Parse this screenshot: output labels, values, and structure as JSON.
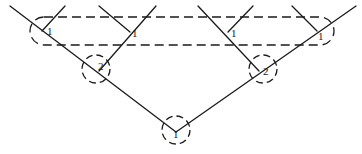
{
  "diagram": {
    "type": "tree",
    "colors": {
      "stroke": "#1a1a1a",
      "background": "#ffffff"
    },
    "nodes": [
      {
        "id": "root",
        "label": "1",
        "x": 176,
        "y": 130
      },
      {
        "id": "left-mid",
        "label": "2",
        "x": 97,
        "y": 68
      },
      {
        "id": "right-mid",
        "label": "2",
        "x": 262,
        "y": 68
      },
      {
        "id": "left-top-outer",
        "label": "1",
        "x": 46,
        "y": 31
      },
      {
        "id": "left-top-inner",
        "label": "1",
        "x": 130,
        "y": 31
      },
      {
        "id": "right-top-inner",
        "label": "1",
        "x": 233,
        "y": 31
      },
      {
        "id": "right-top-outer",
        "label": "1",
        "x": 320,
        "y": 31
      }
    ],
    "group_box": {
      "label": "top-level group",
      "style": "dashed"
    }
  }
}
